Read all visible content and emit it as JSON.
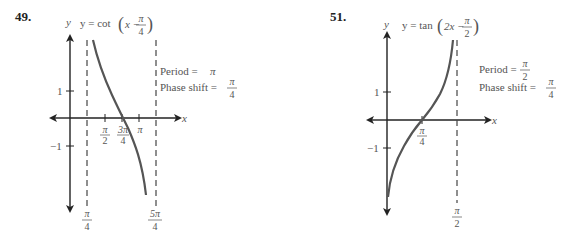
{
  "problems": [
    {
      "number": "49.",
      "equation": {
        "prefix": "y = cot",
        "inner": "x −",
        "frac_num": "π",
        "frac_den": "4"
      },
      "axis_labels": {
        "x": "x",
        "y": "y"
      },
      "y_ticks": [
        {
          "label": "1"
        },
        {
          "label": "−1"
        }
      ],
      "x_ticks": [
        {
          "num": "π",
          "den": "2"
        },
        {
          "num": "3π",
          "den": "4"
        },
        {
          "num": "π",
          "den": ""
        }
      ],
      "asymptote_labels": [
        {
          "num": "π",
          "den": "4"
        },
        {
          "num": "5π",
          "den": "4"
        }
      ],
      "period": {
        "label": "Period =",
        "value": "π"
      },
      "phase_shift": {
        "label": "Phase shift =",
        "num": "π",
        "den": "4"
      }
    },
    {
      "number": "51.",
      "equation": {
        "prefix": "y = tan",
        "inner": "2x −",
        "frac_num": "π",
        "frac_den": "2"
      },
      "axis_labels": {
        "x": "x",
        "y": "y"
      },
      "y_ticks": [
        {
          "label": "1"
        },
        {
          "label": "−1"
        }
      ],
      "x_ticks": [
        {
          "num": "π",
          "den": "4"
        }
      ],
      "asymptote_labels": [
        {
          "num": "π",
          "den": "2"
        }
      ],
      "period": {
        "label": "Period =",
        "num": "π",
        "den": "2"
      },
      "phase_shift": {
        "label": "Phase shift =",
        "num": "π",
        "den": "4"
      }
    }
  ],
  "colors": {
    "axis": "#222222",
    "curve": "#555555",
    "asymptote": "#444444",
    "text": "#555555"
  }
}
